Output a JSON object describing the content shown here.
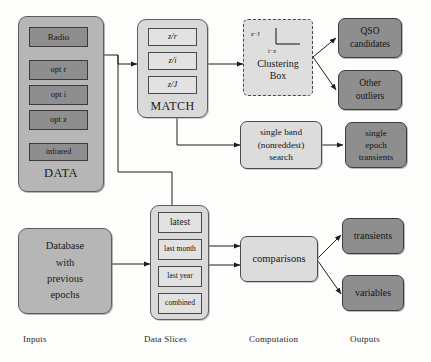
{
  "figure": {
    "column_labels": [
      {
        "id": "inputs",
        "label": "Inputs"
      },
      {
        "id": "data-slices",
        "label": "Data Slices"
      },
      {
        "id": "computation",
        "label": "Computation"
      },
      {
        "id": "outputs",
        "label": "Outputs"
      }
    ],
    "caption_partial": "",
    "colors": {
      "background": "#fdfdfb",
      "dark_box": "#8e8e8e",
      "panel": "#b6b6b6",
      "panel_light": "#d9d9d9",
      "slice_box": "#e2e2e2",
      "outline": "#3a3a3a"
    }
  },
  "inputs": {
    "data_panel": {
      "title": "DATA",
      "bands": [
        {
          "id": "radio",
          "label": "Radio"
        },
        {
          "id": "opt-r",
          "label": "opt r"
        },
        {
          "id": "opt-i",
          "label": "opt i"
        },
        {
          "id": "opt-z",
          "label": "opt z"
        },
        {
          "id": "infrared",
          "label": "infrared"
        }
      ]
    },
    "database": {
      "lines": [
        "Database",
        "with",
        "previous",
        "epochs"
      ],
      "label": "Database with previous epochs"
    }
  },
  "data_slices": {
    "match_panel": {
      "title": "MATCH",
      "pairs": [
        {
          "id": "z-r",
          "label": "z/r"
        },
        {
          "id": "z-i",
          "label": "z/i"
        },
        {
          "id": "z-J",
          "label": "z/J"
        }
      ]
    },
    "epoch_panel": {
      "slices": [
        {
          "id": "latest",
          "label": "latest"
        },
        {
          "id": "last-month",
          "label": "last month"
        },
        {
          "id": "last-year",
          "label": "last year"
        },
        {
          "id": "combined",
          "label": "combined"
        }
      ]
    }
  },
  "computation": {
    "clustering_box": {
      "label_line1": "Clustering",
      "label_line2": "Box",
      "label": "Clustering Box",
      "plot": {
        "ylabel": "z−J",
        "xlabel": "i−z"
      }
    },
    "single_band": {
      "lines": [
        "single band",
        "(nonreddest)",
        "search"
      ],
      "label": "single band (nonreddest) search"
    },
    "comparisons": {
      "label": "comparisons"
    }
  },
  "outputs": {
    "items": [
      {
        "id": "qso-candidates",
        "lines": [
          "QSO",
          "candidates"
        ],
        "label": "QSO candidates"
      },
      {
        "id": "other-outliers",
        "lines": [
          "Other",
          "outliers"
        ],
        "label": "Other outliers"
      },
      {
        "id": "single-epoch-transients",
        "lines": [
          "single",
          "epoch",
          "transients"
        ],
        "label": "single epoch transients"
      },
      {
        "id": "transients",
        "lines": [
          "transients"
        ],
        "label": "transients"
      },
      {
        "id": "variables",
        "lines": [
          "variables"
        ],
        "label": "variables"
      }
    ]
  }
}
